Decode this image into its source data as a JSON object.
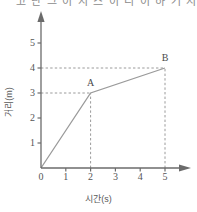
{
  "top_fragment": {
    "text": "고 난 그 이 지 스 이 리 이 하 거 지 의 리 ㄱ 르 ㅡ"
  },
  "chart_data": {
    "type": "line",
    "title": "",
    "xlabel": "시간(s)",
    "ylabel": "거리(m)",
    "xlim": [
      0,
      5.6
    ],
    "ylim": [
      0,
      5.6
    ],
    "xticks": [
      "0",
      "1",
      "2",
      "3",
      "4",
      "5"
    ],
    "xtick_values": [
      0,
      1,
      2,
      3,
      4,
      5
    ],
    "yticks": [
      "1",
      "2",
      "3",
      "4",
      "5"
    ],
    "ytick_values": [
      1,
      2,
      3,
      4,
      5
    ],
    "grid": false,
    "legend": "none",
    "line_color": "#9a9a9a",
    "axis_color": "#6b6b6b",
    "guide_color": "#9a9a9a",
    "series": [
      {
        "name": "distance",
        "points": [
          {
            "x": 0,
            "y": 0,
            "label": ""
          },
          {
            "x": 2,
            "y": 3,
            "label": "A"
          },
          {
            "x": 5,
            "y": 4,
            "label": "B"
          }
        ]
      }
    ],
    "annotations": [
      {
        "name": "point-a-label",
        "text": "A",
        "x": 2,
        "y": 3
      },
      {
        "name": "point-b-label",
        "text": "B",
        "x": 5,
        "y": 4
      }
    ],
    "guide_lines": [
      {
        "name": "hguide-a",
        "type": "horizontal",
        "y": 3,
        "from_x": 0,
        "to_x": 2
      },
      {
        "name": "vguide-a",
        "type": "vertical",
        "x": 2,
        "from_y": 0,
        "to_y": 3
      },
      {
        "name": "hguide-b",
        "type": "horizontal",
        "y": 4,
        "from_x": 0,
        "to_x": 5
      },
      {
        "name": "vguide-b",
        "type": "vertical",
        "x": 5,
        "from_y": 0,
        "to_y": 4
      }
    ]
  }
}
